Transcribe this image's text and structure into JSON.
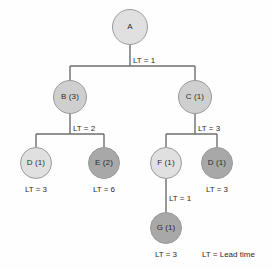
{
  "diagram": {
    "background_color": "#fefefe",
    "line_color": "#6e6e6e",
    "text_color": "#2b2b2b",
    "node_fill_light": "#e0e0e0",
    "node_fill_medium": "#cfcfcf",
    "node_fill_dark": "#a8a8a8",
    "node_border_color": "#9a9a9a"
  },
  "nodes": [
    {
      "id": "A",
      "label": "A",
      "shade": "light",
      "cx": 130,
      "cy": 27,
      "r": 18
    },
    {
      "id": "B",
      "label": "B (3)",
      "shade": "medium",
      "cx": 70,
      "cy": 97,
      "r": 17
    },
    {
      "id": "C",
      "label": "C (1)",
      "shade": "medium",
      "cx": 195,
      "cy": 97,
      "r": 17
    },
    {
      "id": "D1",
      "label": "D (1)",
      "shade": "light",
      "cx": 36,
      "cy": 163,
      "r": 16
    },
    {
      "id": "E",
      "label": "E (2)",
      "shade": "dark",
      "cx": 104,
      "cy": 163,
      "r": 16
    },
    {
      "id": "F",
      "label": "F (1)",
      "shade": "light",
      "cx": 166,
      "cy": 163,
      "r": 16
    },
    {
      "id": "D2",
      "label": "D (1)",
      "shade": "dark",
      "cx": 217,
      "cy": 163,
      "r": 16
    },
    {
      "id": "G",
      "label": "G (1)",
      "shade": "dark",
      "cx": 166,
      "cy": 228,
      "r": 16
    }
  ],
  "edge_labels": [
    {
      "id": "lt-a",
      "text": "LT = 1",
      "x": 133,
      "y": 57
    },
    {
      "id": "lt-b",
      "text": "LT = 2",
      "x": 73,
      "y": 125
    },
    {
      "id": "lt-c",
      "text": "LT = 3",
      "x": 198,
      "y": 125
    },
    {
      "id": "lt-f",
      "text": "LT = 1",
      "x": 169,
      "y": 195
    }
  ],
  "leaf_labels": [
    {
      "id": "lt-d1",
      "text": "LT = 3",
      "cx": 36,
      "y": 186
    },
    {
      "id": "lt-e",
      "text": "LT = 6",
      "cx": 104,
      "y": 186
    },
    {
      "id": "lt-d2",
      "text": "LT = 3",
      "cx": 217,
      "y": 186
    },
    {
      "id": "lt-g",
      "text": "LT = 3",
      "cx": 166,
      "y": 251
    }
  ],
  "legend": {
    "text": "LT = Lead time",
    "x": 202,
    "y": 251
  }
}
